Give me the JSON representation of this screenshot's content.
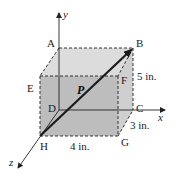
{
  "diagram": {
    "title": "",
    "axes": {
      "x": "x",
      "y": "y",
      "z": "z"
    },
    "vertices": {
      "A": "A",
      "B": "B",
      "C": "C",
      "D": "D",
      "E": "E",
      "F": "F",
      "G": "G",
      "H": "H"
    },
    "vector_label": "P",
    "dimensions": {
      "height": "5 in.",
      "depth": "3 in.",
      "width": "4 in."
    },
    "colors": {
      "top_face": "#dcdcdc",
      "front_face": "#bdbdbd",
      "side_face": "#cfcfcf",
      "edges": "#333333",
      "vector": "#1a1a1a"
    }
  }
}
